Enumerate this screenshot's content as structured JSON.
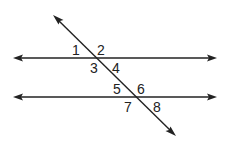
{
  "diagram": {
    "angle_labels": [
      "1",
      "2",
      "3",
      "4",
      "5",
      "6",
      "7",
      "8"
    ]
  }
}
